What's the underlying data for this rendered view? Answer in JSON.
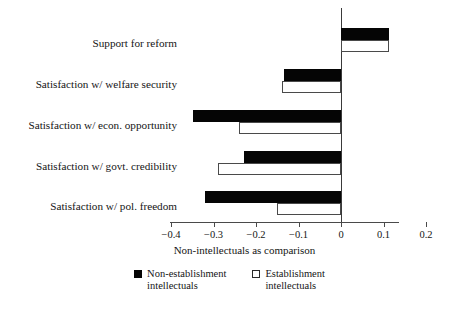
{
  "chart_data": {
    "type": "bar",
    "orientation": "horizontal",
    "title": "",
    "xlabel": "Non-intellectuals as comparison",
    "ylabel": "",
    "xlim": [
      -0.4,
      0.2
    ],
    "xticks": [
      -0.4,
      -0.3,
      -0.2,
      -0.1,
      0,
      0.1,
      0.2
    ],
    "xticklabels": [
      "−0.4",
      "−0.3",
      "−0.2",
      "−0.1",
      "0",
      "0.1",
      "0.2"
    ],
    "grid": false,
    "legend_position": "bottom-center",
    "zero_reference_line": true,
    "categories": [
      "Support for reform",
      "Satisfaction w/ welfare security",
      "Satisfaction w/ econ. opportunity",
      "Satisfaction w/ govt. credibility",
      "Satisfaction w/ pol. freedom"
    ],
    "series": [
      {
        "name": "Non-establishment intellectuals",
        "color": "#050505",
        "fill": "solid",
        "values": [
          0.113,
          -0.134,
          -0.348,
          -0.228,
          -0.32
        ]
      },
      {
        "name": "Establishment intellectuals",
        "color": "#ffffff",
        "fill": "open",
        "values": [
          0.113,
          -0.139,
          -0.24,
          -0.289,
          -0.151
        ]
      }
    ]
  },
  "legend": {
    "items": [
      {
        "label": "Non-establishment\nintellectuals",
        "swatch": "black-square-icon"
      },
      {
        "label": "Establishment\nintellectuals",
        "swatch": "white-square-icon"
      }
    ]
  },
  "axis": {
    "x_title": "Non-intellectuals as comparison"
  }
}
